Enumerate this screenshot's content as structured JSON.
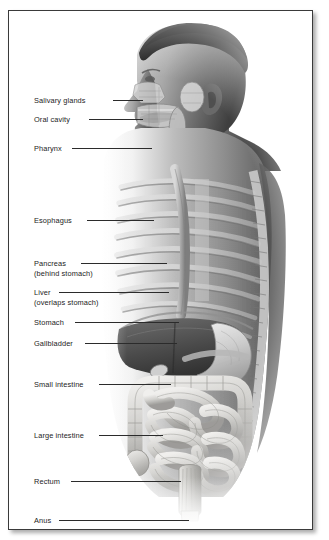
{
  "figure": {
    "style": "grayscale photograph with anatomical overlay, thin dark frame with drop shadow",
    "background_color": "#ffffff",
    "frame_border_color": "#3a3a3a",
    "label_text_color": "#232323",
    "leader_line_color": "#2b2b2b"
  },
  "labels": [
    {
      "id": "salivary-glands",
      "text": "Salivary glands",
      "sub": "",
      "x": 25,
      "y": 85,
      "leader_x": 104,
      "leader_w": 30,
      "leader_y": 89
    },
    {
      "id": "oral-cavity",
      "text": "Oral cavity",
      "sub": "",
      "x": 25,
      "y": 104,
      "leader_x": 80,
      "leader_w": 54,
      "leader_y": 108
    },
    {
      "id": "pharynx",
      "text": "Pharynx",
      "sub": "",
      "x": 25,
      "y": 133,
      "leader_x": 63,
      "leader_w": 80,
      "leader_y": 137
    },
    {
      "id": "esophagus",
      "text": "Esophagus",
      "sub": "",
      "x": 25,
      "y": 205,
      "leader_x": 78,
      "leader_w": 67,
      "leader_y": 209
    },
    {
      "id": "pancreas",
      "text": "Pancreas",
      "sub": "(behind stomach)",
      "x": 25,
      "y": 248,
      "leader_x": 72,
      "leader_w": 86,
      "leader_y": 252
    },
    {
      "id": "liver",
      "text": "Liver",
      "sub": "(overlaps stomach)",
      "x": 25,
      "y": 277,
      "leader_x": 50,
      "leader_w": 110,
      "leader_y": 281
    },
    {
      "id": "stomach",
      "text": "Stomach",
      "sub": "",
      "x": 25,
      "y": 307,
      "leader_x": 66,
      "leader_w": 104,
      "leader_y": 311
    },
    {
      "id": "gallbladder",
      "text": "Gallbladder",
      "sub": "",
      "x": 25,
      "y": 328,
      "leader_x": 76,
      "leader_w": 92,
      "leader_y": 332
    },
    {
      "id": "small-intestine",
      "text": "Small intestine",
      "sub": "",
      "x": 25,
      "y": 369,
      "leader_x": 90,
      "leader_w": 72,
      "leader_y": 373
    },
    {
      "id": "large-intestine",
      "text": "Large intestine",
      "sub": "",
      "x": 25,
      "y": 420,
      "leader_x": 90,
      "leader_w": 64,
      "leader_y": 424
    },
    {
      "id": "rectum",
      "text": "Rectum",
      "sub": "",
      "x": 25,
      "y": 466,
      "leader_x": 62,
      "leader_w": 110,
      "leader_y": 470
    },
    {
      "id": "anus",
      "text": "Anus",
      "sub": "",
      "x": 25,
      "y": 505,
      "leader_x": 50,
      "leader_w": 130,
      "leader_y": 509
    }
  ]
}
